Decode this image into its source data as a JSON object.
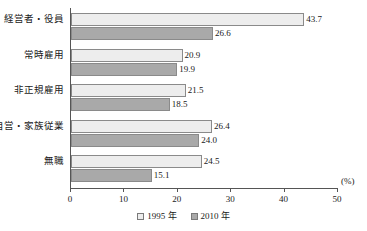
{
  "chart_data": {
    "type": "bar",
    "orientation": "horizontal",
    "title": "",
    "xlabel": "(%)",
    "ylabel": "",
    "xlim": [
      0,
      50
    ],
    "xticks": [
      0,
      10,
      20,
      30,
      40,
      50
    ],
    "grid": false,
    "legend_position": "bottom-center",
    "categories": [
      "経営者・役員",
      "常時雇用",
      "非正規雇用",
      "自営・家族従業",
      "無職"
    ],
    "series": [
      {
        "name": "1995 年",
        "swatch": "light-gray",
        "color": "#ededed",
        "values": [
          43.7,
          20.9,
          21.5,
          26.4,
          24.5
        ],
        "labels": [
          "43.7",
          "20.9",
          "21.5",
          "26.4",
          "24.5"
        ]
      },
      {
        "name": "2010 年",
        "swatch": "medium-gray",
        "color": "#a9a9a9",
        "values": [
          26.6,
          19.9,
          18.5,
          24.0,
          15.1
        ],
        "labels": [
          "26.6",
          "19.9",
          "18.5",
          "24.0",
          "15.1"
        ]
      }
    ],
    "tick_labels": [
      "0",
      "10",
      "20",
      "30",
      "40",
      "50"
    ],
    "unit_label": "(%)"
  },
  "legend": {
    "items": [
      {
        "label": "1995 年"
      },
      {
        "label": "2010 年"
      }
    ]
  }
}
